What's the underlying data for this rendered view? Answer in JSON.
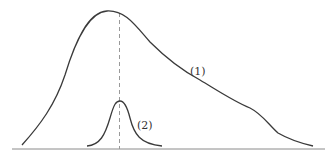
{
  "diagram": {
    "type": "distribution-curves",
    "curves": [
      {
        "id": "curve-1",
        "label": "(1)",
        "description": "broad right-skewed distribution"
      },
      {
        "id": "curve-2",
        "label": "(2)",
        "description": "narrow peaked distribution"
      }
    ],
    "mode_line": {
      "style": "dashed",
      "description": "vertical line at shared peak"
    },
    "colors": {
      "curve": "#3a3a3a",
      "axis": "#8a8a8a",
      "dashed": "#999999",
      "background": "#ffffff"
    }
  }
}
